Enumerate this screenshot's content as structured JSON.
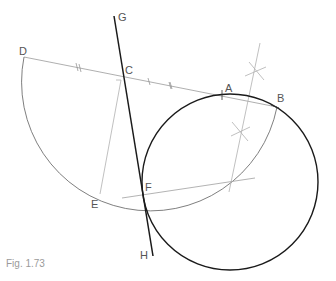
{
  "figure": {
    "caption": "Fig. 1.73",
    "points": {
      "A": "A",
      "B": "B",
      "C": "C",
      "D": "D",
      "E": "E",
      "F": "F",
      "G": "G",
      "H": "H"
    },
    "colors": {
      "construction": "#a0a0a0",
      "primary": "#1a1a1a",
      "label": "#555555"
    }
  }
}
